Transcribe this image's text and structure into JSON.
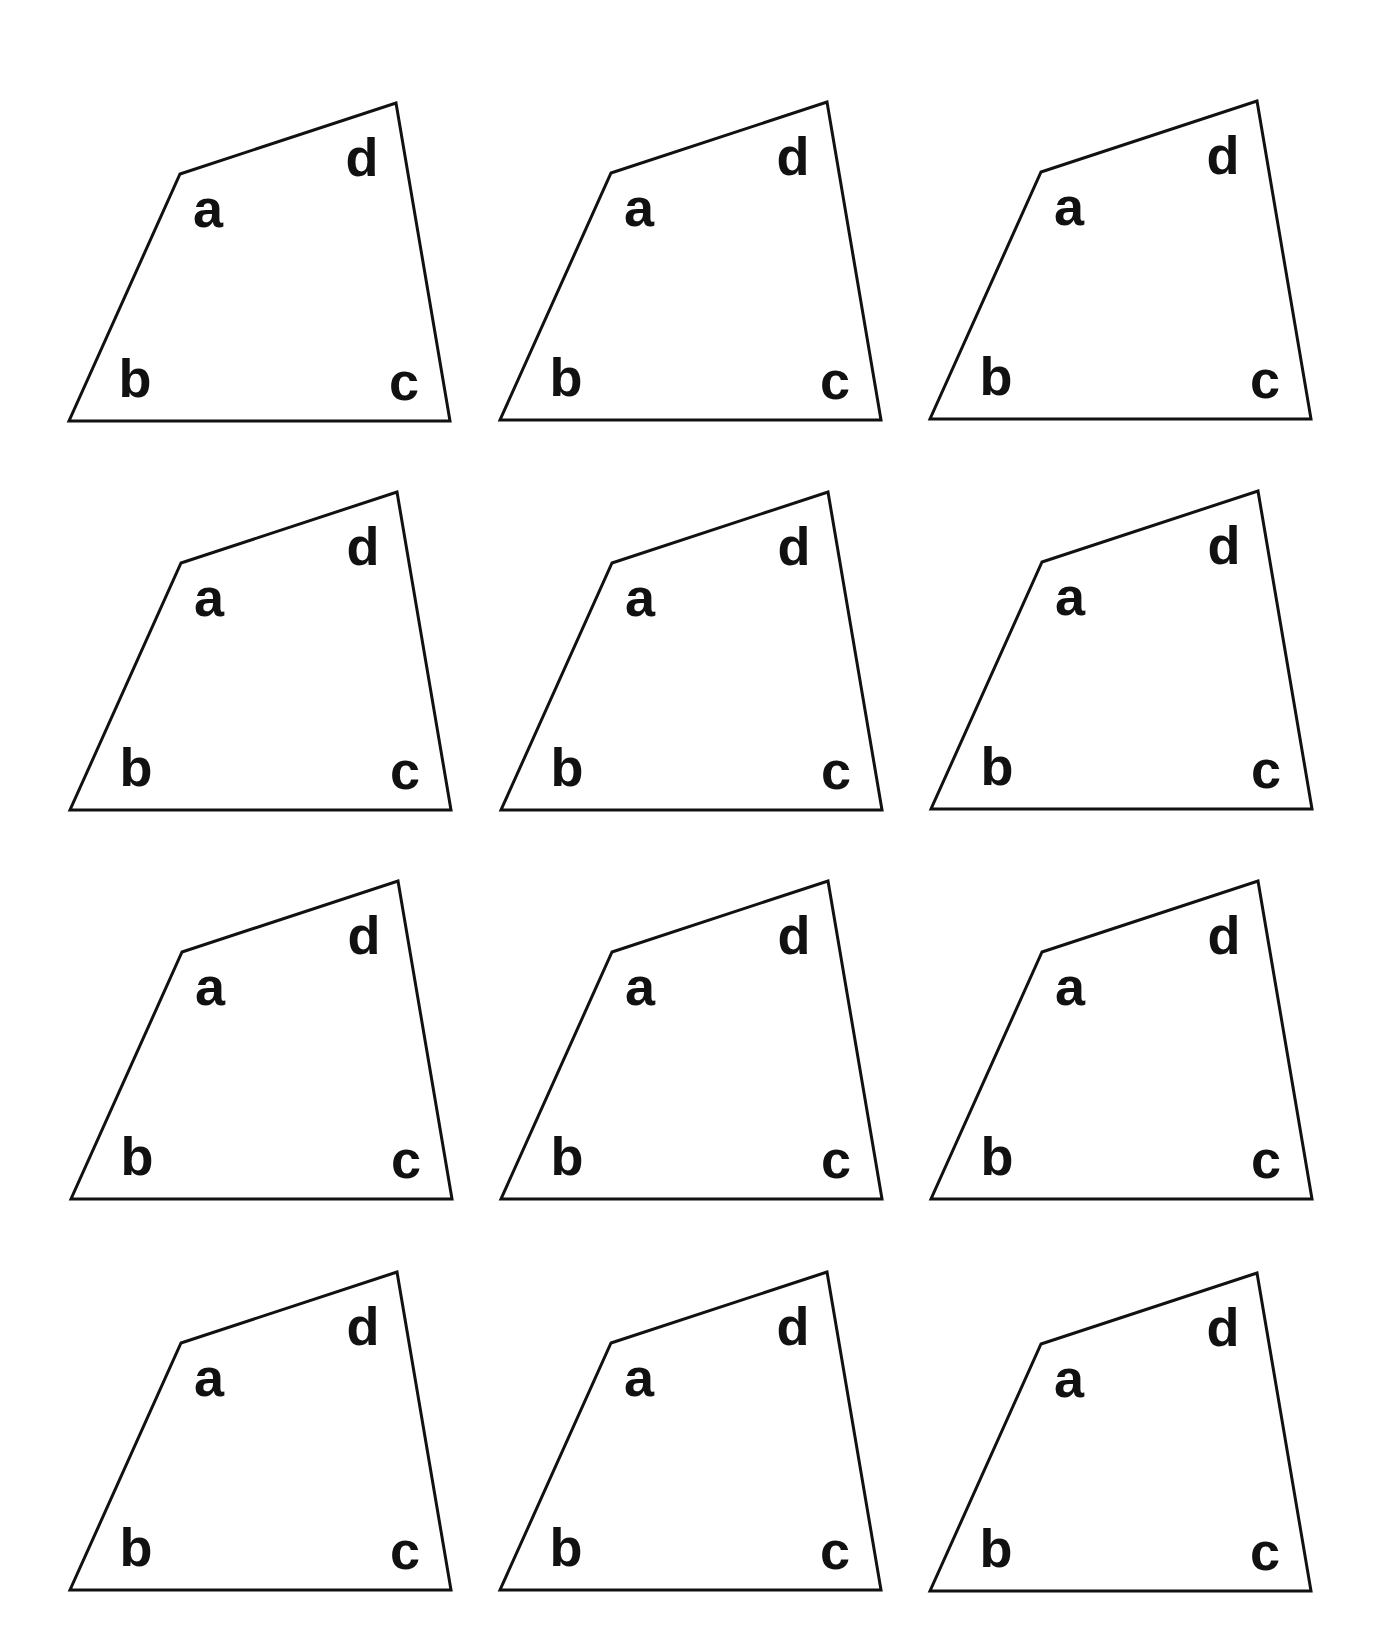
{
  "title": "",
  "grid": {
    "rows": 4,
    "cols": 3
  },
  "colors": {
    "stroke": "#111111",
    "fill": "#ffffff",
    "label": "#111111"
  },
  "shape_template": {
    "description": "Irregular quadrilateral with vertices labelled a, b, c, d",
    "vertices_relative_to_b": {
      "a": [
        111,
        -247
      ],
      "b": [
        0,
        0
      ],
      "c": [
        381,
        0
      ],
      "d": [
        327,
        -318
      ]
    },
    "label_centers_relative_to_b": {
      "a": [
        139,
        -213
      ],
      "b": [
        66,
        -43
      ],
      "c": [
        335,
        -40
      ],
      "d": [
        293,
        -264
      ]
    },
    "labels": {
      "a": "a",
      "b": "b",
      "c": "c",
      "d": "d"
    }
  },
  "cells": [
    {
      "row": 1,
      "col": 1,
      "b": [
        69,
        421
      ]
    },
    {
      "row": 1,
      "col": 2,
      "b": [
        500,
        420
      ]
    },
    {
      "row": 1,
      "col": 3,
      "b": [
        930,
        419
      ]
    },
    {
      "row": 2,
      "col": 1,
      "b": [
        70,
        810
      ]
    },
    {
      "row": 2,
      "col": 2,
      "b": [
        501,
        810
      ]
    },
    {
      "row": 2,
      "col": 3,
      "b": [
        931,
        809
      ]
    },
    {
      "row": 3,
      "col": 1,
      "b": [
        71,
        1199
      ]
    },
    {
      "row": 3,
      "col": 2,
      "b": [
        501,
        1199
      ]
    },
    {
      "row": 3,
      "col": 3,
      "b": [
        931,
        1199
      ]
    },
    {
      "row": 4,
      "col": 1,
      "b": [
        70,
        1590
      ]
    },
    {
      "row": 4,
      "col": 2,
      "b": [
        500,
        1590
      ]
    },
    {
      "row": 4,
      "col": 3,
      "b": [
        930,
        1591
      ]
    }
  ]
}
